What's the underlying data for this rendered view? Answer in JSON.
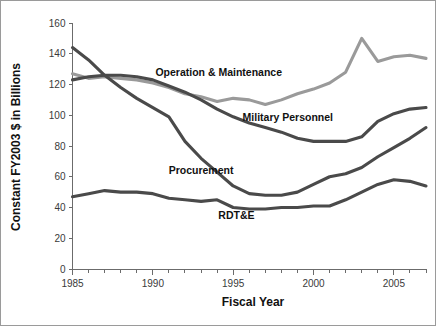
{
  "chart_data": {
    "type": "line",
    "title": "",
    "xlabel": "Fiscal Year",
    "ylabel": "Constant FY2003 $ in Billions",
    "xlim": [
      1985,
      2007
    ],
    "ylim": [
      0,
      160
    ],
    "grid": false,
    "legend_position": "inline-labels",
    "x_ticks_major": [
      1985,
      1990,
      1995,
      2000,
      2005
    ],
    "x_ticks_major_labels": [
      "1985",
      "1990",
      "1995",
      "2000",
      "2005"
    ],
    "x_tick_step_minor": 1,
    "y_ticks": [
      0,
      20,
      40,
      60,
      80,
      100,
      120,
      140,
      160
    ],
    "y_tick_labels": [
      "0",
      "20",
      "40",
      "60",
      "80",
      "100",
      "120",
      "140",
      "160"
    ],
    "x": [
      1985,
      1986,
      1987,
      1988,
      1989,
      1990,
      1991,
      1992,
      1993,
      1994,
      1995,
      1996,
      1997,
      1998,
      1999,
      2000,
      2001,
      2002,
      2003,
      2004,
      2005,
      2006,
      2007
    ],
    "series": [
      {
        "name": "Operation & Maintenance",
        "color": "#9a9a9a",
        "label_x": 1994.1,
        "label_y": 125.5,
        "values": [
          127,
          124,
          125,
          124,
          123,
          121,
          118,
          114,
          112,
          109,
          111,
          110,
          107,
          110,
          114,
          117,
          121,
          128,
          150,
          135,
          138,
          139,
          137
        ]
      },
      {
        "name": "Military Personnel",
        "color": "#4a4a4a",
        "label_x": 1998.4,
        "label_y": 96.5,
        "values": [
          123,
          125,
          126,
          126,
          125,
          123,
          119,
          115,
          110,
          104,
          99,
          95,
          92,
          89,
          85,
          83,
          83,
          83,
          86,
          96,
          101,
          104,
          105
        ]
      },
      {
        "name": "Procurement",
        "color": "#4a4a4a",
        "label_x": 1993.0,
        "label_y": 62.0,
        "values": [
          144,
          136,
          126,
          118,
          111,
          105,
          99,
          83,
          72,
          63,
          54,
          49,
          48,
          48,
          50,
          55,
          60,
          62,
          66,
          73,
          79,
          85,
          92
        ]
      },
      {
        "name": "RDT&E",
        "color": "#4a4a4a",
        "label_x": 1995.2,
        "label_y": 32.5,
        "values": [
          47,
          49,
          51,
          50,
          50,
          49,
          46,
          45,
          44,
          45,
          40,
          39,
          39,
          40,
          40,
          41,
          41,
          45,
          50,
          55,
          58,
          57,
          54
        ]
      }
    ]
  }
}
